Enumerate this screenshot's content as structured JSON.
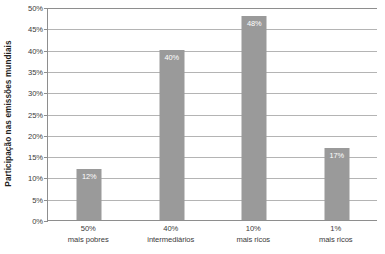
{
  "chart_data": {
    "type": "bar",
    "title": "",
    "subtitle": "",
    "xlabel": "",
    "ylabel": "Participação nas emissões mundiais",
    "categories": [
      "50% mais pobres",
      "40% intermediários",
      "10% mais ricos",
      "1% mais ricos"
    ],
    "category_lines": [
      {
        "line1": "50%",
        "line2": "mais pobres"
      },
      {
        "line1": "40%",
        "line2": "intermediários"
      },
      {
        "line1": "10%",
        "line2": "mais ricos"
      },
      {
        "line1": "1%",
        "line2": "mais ricos"
      }
    ],
    "values": [
      12,
      40,
      48,
      17
    ],
    "value_labels": [
      "12%",
      "40%",
      "48%",
      "17%"
    ],
    "ylim": [
      0,
      50
    ],
    "ytick_values": [
      0,
      5,
      10,
      15,
      20,
      25,
      30,
      35,
      40,
      45,
      50
    ],
    "ytick_labels": [
      "0%",
      "5%",
      "10%",
      "15%",
      "20%",
      "25%",
      "30%",
      "35%",
      "40%",
      "45%",
      "50%"
    ],
    "grid": true,
    "legend": false,
    "legend_position": "none",
    "bar_color": "#9a9a9a",
    "value_label_color": "#ffffff",
    "gridline_color": "#b4b4b4",
    "axis_color": "#8e8e8e",
    "background_color": "#ffffff"
  }
}
